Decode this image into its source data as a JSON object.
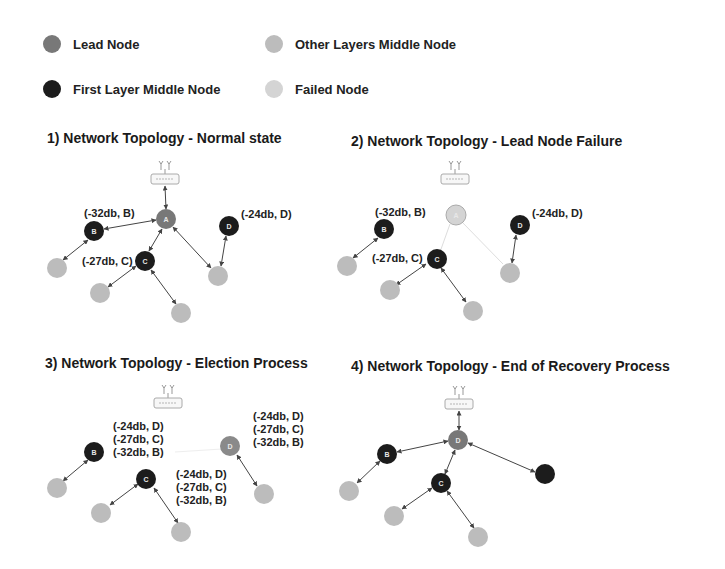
{
  "legend": [
    {
      "label": "Lead Node",
      "color": "#7a7a7a"
    },
    {
      "label": "Other Layers Middle Node",
      "color": "#bdbdbd"
    },
    {
      "label": "First Layer Middle Node",
      "color": "#1c1c1c"
    },
    {
      "label": "Failed Node",
      "color": "#d2d2d2"
    }
  ],
  "colors": {
    "lead": "#787878",
    "first_layer": "#1c1c1c",
    "other_layers": "#bcbcbc",
    "failed": "#d4d4d4",
    "edge": "#444444"
  },
  "panels": [
    {
      "title": "1) Network Topology - Normal state",
      "nodes": [
        {
          "id": "A",
          "label": "A",
          "type": "lead"
        },
        {
          "id": "B",
          "label": "B",
          "type": "first_layer"
        },
        {
          "id": "C",
          "label": "C",
          "type": "first_layer"
        },
        {
          "id": "D",
          "label": "D",
          "type": "first_layer"
        }
      ],
      "annotations": [
        "(-32db, B)",
        "(-27db, C)",
        "(-24db, D)"
      ]
    },
    {
      "title": "2) Network Topology - Lead Node Failure",
      "nodes": [
        {
          "id": "A",
          "label": "A",
          "type": "failed"
        },
        {
          "id": "B",
          "label": "B",
          "type": "first_layer"
        },
        {
          "id": "C",
          "label": "C",
          "type": "first_layer"
        },
        {
          "id": "D",
          "label": "D",
          "type": "first_layer"
        }
      ],
      "annotations": [
        "(-32db, B)",
        "(-27db, C)",
        "(-24db, D)"
      ]
    },
    {
      "title": "3) Network Topology - Election Process",
      "nodes": [
        {
          "id": "B",
          "label": "B",
          "type": "first_layer"
        },
        {
          "id": "C",
          "label": "C",
          "type": "first_layer"
        },
        {
          "id": "D",
          "label": "D",
          "type": "lead"
        }
      ],
      "annotations": {
        "B": [
          "(-24db, D)",
          "(-27db, C)",
          "(-32db, B)"
        ],
        "C": [
          "(-24db, D)",
          "(-27db, C)",
          "(-32db, B)"
        ],
        "D": [
          "(-24db, D)",
          "(-27db, C)",
          "(-32db, B)"
        ]
      }
    },
    {
      "title": "4) Network Topology - End of Recovery Process",
      "nodes": [
        {
          "id": "D",
          "label": "D",
          "type": "lead"
        },
        {
          "id": "B",
          "label": "B",
          "type": "first_layer"
        },
        {
          "id": "C",
          "label": "C",
          "type": "first_layer"
        },
        {
          "id": "E",
          "label": "",
          "type": "first_layer"
        }
      ],
      "annotations": []
    }
  ]
}
